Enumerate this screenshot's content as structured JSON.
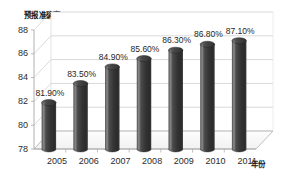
{
  "chart_data": {
    "type": "bar",
    "title": "",
    "ylabel": "预报准确率 %",
    "xlabel": "年份",
    "categories": [
      "2005",
      "2006",
      "2007",
      "2008",
      "2009",
      "2010",
      "2011"
    ],
    "values": [
      81.9,
      83.5,
      84.9,
      85.6,
      86.3,
      86.8,
      87.1
    ],
    "data_labels": [
      "81.90%",
      "83.50%",
      "84.90%",
      "85.60%",
      "86.30%",
      "86.80%",
      "87.10%"
    ],
    "ylim": [
      78,
      88
    ],
    "ytick_labels": [
      "78",
      "80",
      "82",
      "84",
      "86",
      "88"
    ],
    "ytick_values": [
      78,
      80,
      82,
      84,
      86,
      88
    ],
    "grid": true,
    "legend": false,
    "style": "3d-cylinder",
    "colors": {
      "bar_light": "#6e6e6e",
      "bar_mid": "#3a3a3a",
      "bar_dark": "#2a2a2a",
      "gridline": "#c9c9c9",
      "axis": "#a8a8a8",
      "floor": "#fbfbfb",
      "text": "#1f1f1f",
      "background": "#ffffff"
    }
  }
}
